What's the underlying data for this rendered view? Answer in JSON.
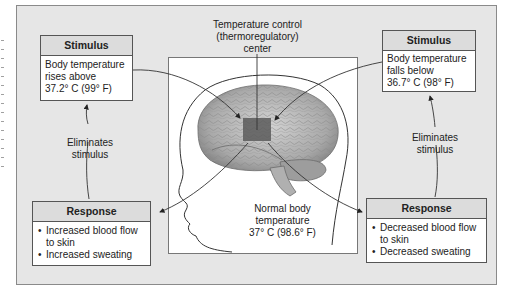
{
  "diagram": {
    "title": "Temperature control (thermoregulatory) center",
    "center_label": {
      "lines": [
        "Temperature control",
        "(thermoregulatory)",
        "center"
      ]
    },
    "normal_label": {
      "lines": [
        "Normal body",
        "temperature",
        "37° C (98.6° F)"
      ]
    },
    "left_stimulus": {
      "header": "Stimulus",
      "lines": [
        "Body temperature",
        "rises above",
        "37.2° C (99° F)"
      ]
    },
    "right_stimulus": {
      "header": "Stimulus",
      "lines": [
        "Body temperature",
        "falls below",
        "36.7° C (98° F)"
      ]
    },
    "left_response": {
      "header": "Response",
      "items": [
        "Increased blood flow to skin",
        "Increased sweating"
      ],
      "item_lines": [
        [
          "Increased blood flow",
          "to skin"
        ],
        [
          "Increased sweating"
        ]
      ]
    },
    "right_response": {
      "header": "Response",
      "items": [
        "Decreased blood flow to skin",
        "Decreased sweating"
      ],
      "item_lines": [
        [
          "Decreased blood flow",
          "to skin"
        ],
        [
          "Decreased sweating"
        ]
      ]
    },
    "left_feedback": {
      "lines": [
        "Eliminates",
        "stimulus"
      ]
    },
    "right_feedback": {
      "lines": [
        "Eliminates",
        "stimulus"
      ]
    },
    "colors": {
      "panel_bg": "#e6e6e6",
      "box_header_bg": "#dcdcdc",
      "hypothalamus_region": "#5a5a5a",
      "brain": "#b8b8b8"
    }
  }
}
